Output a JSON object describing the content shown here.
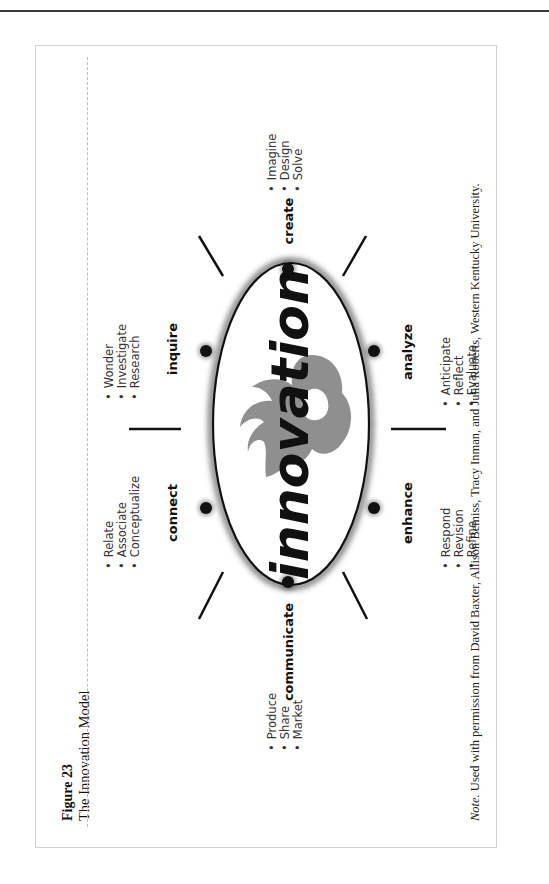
{
  "figure": {
    "label": "Figure 23",
    "title": "The Innovation Model",
    "note_prefix": "Note.",
    "note_text": " Used with permission from David Baxter, Allison Bemiss, Tracy Inman, and Julia Roberts, Western Kentucky University."
  },
  "center": {
    "word": "innovation",
    "logo": "flame-logo"
  },
  "stages": [
    {
      "name": "create",
      "bullets": [
        "Imagine",
        "Design",
        "Solve"
      ]
    },
    {
      "name": "analyze",
      "bullets": [
        "Anticipate",
        "Reflect",
        "Evaluate"
      ]
    },
    {
      "name": "enhance",
      "bullets": [
        "Respond",
        "Revision",
        "Refine"
      ]
    },
    {
      "name": "communicate",
      "bullets": [
        "Produce",
        "Share",
        "Market"
      ]
    },
    {
      "name": "connect",
      "bullets": [
        "Relate",
        "Associate",
        "Conceptualize"
      ]
    },
    {
      "name": "inquire",
      "bullets": [
        "Wonder",
        "Investigate",
        "Research"
      ]
    }
  ],
  "colors": {
    "ink": "#111111",
    "flame": "#8f8f8f",
    "border": "#cfcfcf"
  }
}
